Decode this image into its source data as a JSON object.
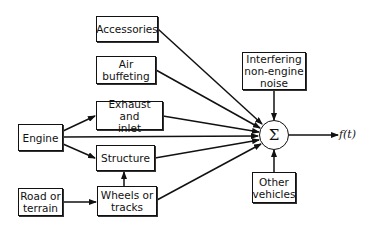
{
  "diagram": {
    "type": "block-diagram",
    "nodes": {
      "accessories": "Accessories",
      "air_buffeting": "Air\nbuffeting",
      "exhaust_inlet": "Exhaust and\ninlet",
      "structure": "Structure",
      "wheels_tracks": "Wheels or\ntracks",
      "engine": "Engine",
      "road_terrain": "Road or\nterrain",
      "interfering_noise": "Interfering\nnon-engine\nnoise",
      "other_vehicles": "Other\nvehicles",
      "summation": "Σ",
      "output": "f(t)"
    },
    "edges": [
      {
        "from": "Engine",
        "to": "Exhaust and inlet"
      },
      {
        "from": "Engine",
        "to": "Σ"
      },
      {
        "from": "Engine",
        "to": "Structure"
      },
      {
        "from": "Road or terrain",
        "to": "Wheels or tracks"
      },
      {
        "from": "Wheels or tracks",
        "to": "Structure"
      },
      {
        "from": "Accessories",
        "to": "Σ"
      },
      {
        "from": "Air buffeting",
        "to": "Σ"
      },
      {
        "from": "Exhaust and inlet",
        "to": "Σ"
      },
      {
        "from": "Structure",
        "to": "Σ"
      },
      {
        "from": "Wheels or tracks",
        "to": "Σ"
      },
      {
        "from": "Interfering non-engine noise",
        "to": "Σ"
      },
      {
        "from": "Other vehicles",
        "to": "Σ"
      },
      {
        "from": "Σ",
        "to": "f(t)"
      }
    ]
  }
}
